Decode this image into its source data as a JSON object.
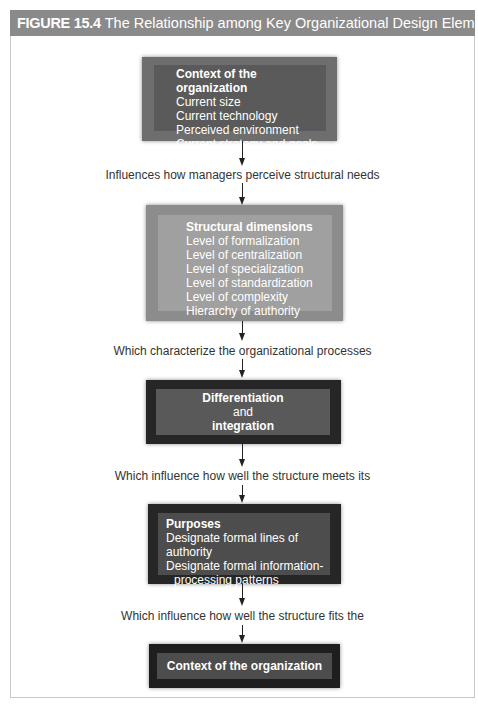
{
  "figure": {
    "number": "FIGURE 15.4",
    "title": "The Relationship among Key Organizational Design Elements"
  },
  "boxes": [
    {
      "heading": "Context of the organization",
      "items": [
        "Current size",
        "Current technology",
        "Perceived environment",
        "Current strategy and goals"
      ],
      "outer_color": "#6e6e6e",
      "inner_color": "#5a5a5a"
    },
    {
      "heading": "Structural dimensions",
      "items": [
        "Level of formalization",
        "Level of centralization",
        "Level of specialization",
        "Level of standardization",
        "Level of complexity",
        "Hierarchy of authority"
      ],
      "outer_color": "#8c8c8c",
      "inner_color": "#a0a0a0"
    },
    {
      "heading": "Differentiation",
      "middle": "and",
      "heading2": "integration",
      "outer_color": "#262626",
      "inner_color": "#595959"
    },
    {
      "heading": "Purposes",
      "items": [
        "Designate formal lines of authority",
        "Designate formal information-",
        "processing patterns"
      ],
      "outer_color": "#262626",
      "inner_color": "#4d4d4d"
    },
    {
      "heading": "Context of the organization",
      "outer_color": "#1e1e1e",
      "inner_color": "#4d4d4d"
    }
  ],
  "captions": [
    "Influences how managers perceive structural needs",
    "Which characterize the organizational processes",
    "Which influence how well the structure meets its",
    "Which influence how well the structure fits the"
  ]
}
